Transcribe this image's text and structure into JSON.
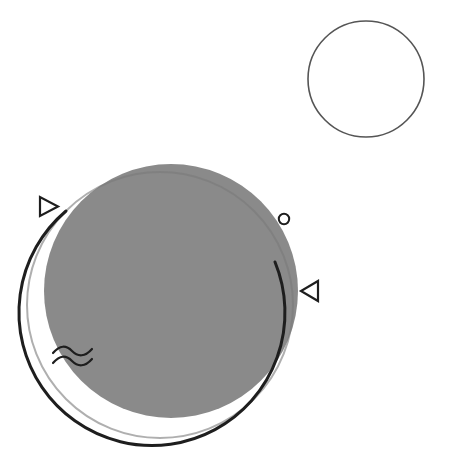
{
  "composition": {
    "width": 449,
    "height": 460,
    "background": "#ffffff",
    "colors": {
      "fill_gray": "#8a8a8a",
      "stroke_dark": "#1e1e1e",
      "stroke_thin": "#555555",
      "inner_line": "#7a7a7a"
    },
    "shapes": [
      {
        "name": "filled-gray-circle",
        "type": "circle",
        "cx": 171,
        "cy": 291,
        "r": 127,
        "fill": "#8a8a8a"
      },
      {
        "name": "large-outline-circle",
        "type": "circle",
        "cx": 160,
        "cy": 305,
        "r": 133,
        "stroke": "#1e1e1e",
        "stroke_width": 3
      },
      {
        "name": "small-outline-circle",
        "type": "circle",
        "cx": 366,
        "cy": 79,
        "r": 58,
        "stroke": "#555555",
        "stroke_width": 1.5
      },
      {
        "name": "tiny-ring",
        "type": "circle",
        "cx": 284,
        "cy": 219,
        "r": 5,
        "stroke": "#1e1e1e",
        "stroke_width": 2
      },
      {
        "name": "triangle-right",
        "type": "triangle",
        "points": "40,197 40,216 59,206"
      },
      {
        "name": "triangle-left",
        "type": "triangle",
        "points": "318,281 318,301 300,291"
      },
      {
        "name": "wave-lines",
        "type": "waves",
        "count": 2
      }
    ]
  }
}
